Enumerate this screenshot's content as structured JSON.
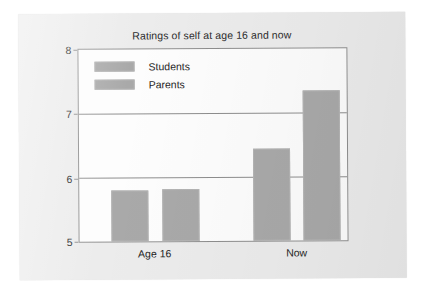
{
  "figure": {
    "title": "Ratings of self at age 16 and now"
  },
  "legend": {
    "items": [
      {
        "label": "Students",
        "color": "#a9a9a9"
      },
      {
        "label": "Parents",
        "color": "#a9a9a9"
      }
    ]
  },
  "axis": {
    "y_ticks": [
      "8",
      "7",
      "6",
      "5"
    ],
    "x_ticks": [
      "Age 16",
      "Now"
    ]
  },
  "chart_data": {
    "type": "bar",
    "title": "Ratings of self at age 16 and now",
    "xlabel": "",
    "ylabel": "",
    "categories": [
      "Age 16",
      "Now"
    ],
    "series": [
      {
        "name": "Students",
        "values": [
          5.79,
          6.44
        ],
        "color": "#a9a9a9"
      },
      {
        "name": "Parents",
        "values": [
          5.82,
          7.35
        ],
        "color": "#a9a9a9"
      }
    ],
    "ylim": [
      5,
      8
    ],
    "yticks": [
      5,
      6,
      7,
      8
    ],
    "grid": true,
    "grid_axis": "y",
    "legend_position": "upper-left-inside",
    "bar_border_color": "#b4b4b4",
    "plot_background": "#fdfdfd",
    "axis_color": "#8e8e8e"
  }
}
